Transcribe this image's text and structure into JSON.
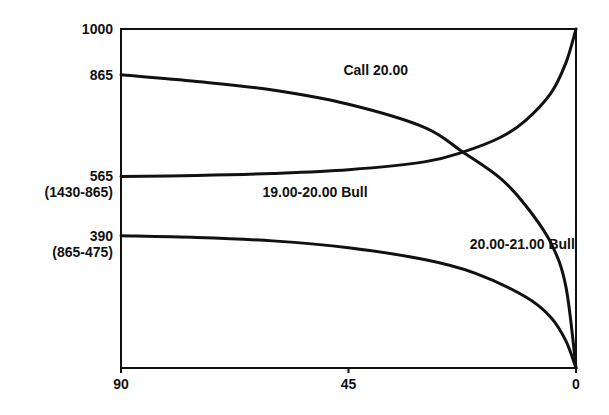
{
  "chart_data": {
    "type": "line",
    "title": "",
    "xlabel": "",
    "ylabel": "",
    "xlim": [
      90,
      0
    ],
    "ylim": [
      0,
      1000
    ],
    "grid": false,
    "legend": "none (inline labels)",
    "x_ticks": [
      {
        "value": 90,
        "label": "90"
      },
      {
        "value": 45,
        "label": "45"
      },
      {
        "value": 0,
        "label": "0"
      }
    ],
    "y_ticks": [
      {
        "value": 1000,
        "label": "1000",
        "sublabel": ""
      },
      {
        "value": 865,
        "label": "865",
        "sublabel": ""
      },
      {
        "value": 565,
        "label": "565",
        "sublabel": "(1430-865)"
      },
      {
        "value": 390,
        "label": "390",
        "sublabel": "(865-475)"
      }
    ],
    "series": [
      {
        "name": "Call 20.00",
        "label_pos": {
          "x": 46,
          "y": 865
        },
        "x": [
          90,
          75,
          60,
          45,
          30,
          22.4,
          15,
          10,
          5,
          2,
          0
        ],
        "values": [
          865,
          845,
          820,
          778,
          710,
          637,
          560,
          480,
          370,
          240,
          0
        ]
      },
      {
        "name": "19.00-20.00 Bull",
        "label_pos": {
          "x": 62,
          "y": 505
        },
        "x": [
          90,
          75,
          60,
          45,
          30,
          22.4,
          15,
          10,
          5,
          2,
          0
        ],
        "values": [
          565,
          568,
          574,
          585,
          608,
          637,
          680,
          730,
          810,
          900,
          1000
        ]
      },
      {
        "name": "20.00-21.00 Bull",
        "label_pos": {
          "x": 21,
          "y": 350
        },
        "x": [
          90,
          75,
          60,
          45,
          30,
          20,
          10,
          5,
          2,
          0
        ],
        "values": [
          390,
          385,
          375,
          355,
          320,
          280,
          210,
          150,
          80,
          0
        ]
      }
    ]
  }
}
